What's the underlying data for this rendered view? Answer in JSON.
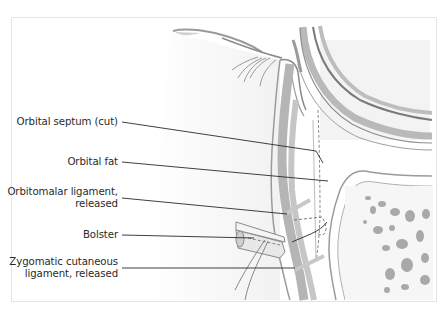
{
  "figure": {
    "labels": [
      {
        "id": "orbital-septum",
        "lines": [
          "Orbital septum (cut)"
        ],
        "top": 116
      },
      {
        "id": "orbital-fat",
        "lines": [
          "Orbital fat"
        ],
        "top": 156
      },
      {
        "id": "orbitomalar-ligament",
        "lines": [
          "Orbitomalar ligament,",
          "released"
        ],
        "top": 186
      },
      {
        "id": "bolster",
        "lines": [
          "Bolster"
        ],
        "top": 231
      },
      {
        "id": "zygomatic-cutaneous-ligament",
        "lines": [
          "Zygomatic cutaneous",
          "ligament, released"
        ],
        "top": 256
      }
    ],
    "leaders": [
      {
        "label": "orbital-septum",
        "x1": 122,
        "y1": 122,
        "x2": 316,
        "y2": 151
      },
      {
        "label": "orbital-fat",
        "x1": 122,
        "y1": 162,
        "x2": 328,
        "y2": 181
      },
      {
        "label": "orbitomalar-ligament",
        "x1": 122,
        "y1": 198,
        "x2": 287,
        "y2": 214
      },
      {
        "label": "bolster",
        "x1": 122,
        "y1": 235,
        "x2": 254,
        "y2": 238
      },
      {
        "label": "zygomatic-cutaneous-ligament",
        "x1": 122,
        "y1": 268,
        "x2": 295,
        "y2": 268
      }
    ],
    "colors": {
      "tissue_gray": "#b9b9b9",
      "tissue_light": "#dedede",
      "line": "#2a2a2a",
      "bone_pore": "#a8a8a8"
    }
  }
}
